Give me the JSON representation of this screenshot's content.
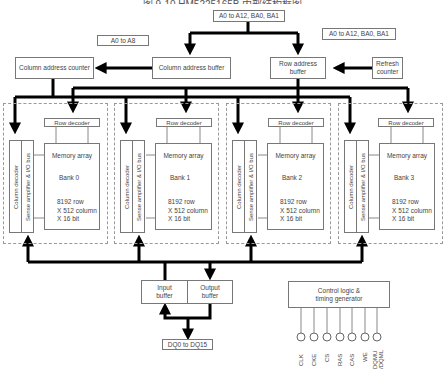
{
  "title": "图 9-10    HM5225165B 内部结构框图",
  "address_inputs": {
    "top": "A0 to A12, BA0, BA1",
    "left": "A0 to A8",
    "right": "A0 to A12, BA0, BA1"
  },
  "blocks": {
    "column_address_counter": "Column address counter",
    "column_address_buffer": "Column address buffer",
    "row_address_buffer": "Row address buffer",
    "refresh_counter": "Refresh counter",
    "input_buffer": "Input buffer",
    "output_buffer": "Output buffer",
    "dq": "DQ0 to DQ15",
    "control_logic": "Control logic & timing generator"
  },
  "banks": [
    {
      "name": "Bank 0",
      "row_decoder": "Row decoder",
      "column_decoder": "Column decoder",
      "sense_amp": "Sense amplifier & I/O bus",
      "array": "Memory array",
      "spec": [
        "8192 row",
        "X 512 column",
        "X 16 bit"
      ]
    },
    {
      "name": "Bank 1",
      "row_decoder": "Row decoder",
      "column_decoder": "Column decoder",
      "sense_amp": "Sense amplifier & I/O bus",
      "array": "Memory array",
      "spec": [
        "8192 row",
        "X 512 column",
        "X 16 bit"
      ]
    },
    {
      "name": "Bank 2",
      "row_decoder": "Row decoder",
      "column_decoder": "Column decoder",
      "sense_amp": "Sense amplifier & I/O bus",
      "array": "Memory array",
      "spec": [
        "8192 row",
        "X 512 column",
        "X 16 bit"
      ]
    },
    {
      "name": "Bank 3",
      "row_decoder": "Row decoder",
      "column_decoder": "Column decoder",
      "sense_amp": "Sense amplifier & I/O bus",
      "array": "Memory array",
      "spec": [
        "8192 row",
        "X 512 column",
        "X 16 bit"
      ]
    }
  ],
  "control_signals": [
    "CLK",
    "CKE",
    "CS",
    "RAS",
    "CAS",
    "WE",
    "DQMU /DQML"
  ]
}
